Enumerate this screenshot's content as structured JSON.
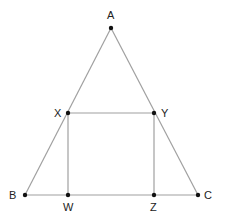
{
  "diagram": {
    "type": "geometry",
    "colors": {
      "line": "#a0a0a0",
      "point": "#111111",
      "label": "#222222",
      "background": "#ffffff"
    },
    "points": {
      "A": {
        "label": "A",
        "x": 111,
        "y": 28
      },
      "B": {
        "label": "B",
        "x": 25,
        "y": 195
      },
      "C": {
        "label": "C",
        "x": 198,
        "y": 195
      },
      "X": {
        "label": "X",
        "x": 68,
        "y": 113
      },
      "Y": {
        "label": "Y",
        "x": 154,
        "y": 113
      },
      "W": {
        "label": "W",
        "x": 68,
        "y": 195
      },
      "Z": {
        "label": "Z",
        "x": 154,
        "y": 195
      }
    },
    "segments": [
      [
        "A",
        "B"
      ],
      [
        "A",
        "C"
      ],
      [
        "B",
        "C"
      ],
      [
        "X",
        "Y"
      ],
      [
        "X",
        "W"
      ],
      [
        "Y",
        "Z"
      ]
    ]
  }
}
